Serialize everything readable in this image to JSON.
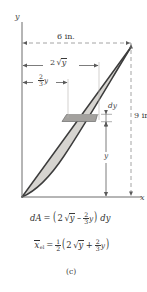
{
  "figure": {
    "caption": "(c)",
    "axes": {
      "y_label": "y",
      "x_label": "x"
    },
    "dimensions": [
      {
        "name": "top-width",
        "label": "6 in.",
        "value": 6,
        "unit": "in.",
        "orientation": "horizontal",
        "style": "dashed-extension"
      },
      {
        "name": "right-height",
        "label": "9 in.",
        "value": 9,
        "unit": "in.",
        "orientation": "vertical",
        "style": "dashed-extension"
      },
      {
        "name": "parabola-x",
        "label_parts": {
          "coef": "2",
          "radicand": "y",
          "radical": "√"
        },
        "label_plain": "2√y",
        "orientation": "horizontal"
      },
      {
        "name": "line-x",
        "label_parts": {
          "num": "2",
          "den": "3",
          "var": "y"
        },
        "label_plain": "2/3 y",
        "orientation": "horizontal"
      },
      {
        "name": "strip-thickness",
        "label": "dy",
        "orientation": "vertical"
      },
      {
        "name": "height-y",
        "label": "y",
        "orientation": "vertical"
      }
    ],
    "equations": {
      "area": {
        "lhs_d": "d",
        "lhs_A": "A",
        "eq": "=",
        "open": "(",
        "coef": "2",
        "radical": "√",
        "radicand": "y",
        "minus": "–",
        "frac_num": "2",
        "frac_den": "3",
        "frac_var": "y",
        "close": ")",
        "trail_d": "d",
        "trail_y": "y",
        "plain": "dA = (2√y – 2/3 y) dy"
      },
      "centroid": {
        "lhs_x": "x",
        "lhs_sub": "el",
        "eq": "=",
        "half_num": "1",
        "half_den": "2",
        "open": "(",
        "coef": "2",
        "radical": "√",
        "radicand": "y",
        "plus": "+",
        "frac_num": "2",
        "frac_den": "3",
        "frac_var": "y",
        "close": ")",
        "plain": "x̄_el = 1/2 (2√y + 2/3 y)"
      }
    },
    "colors": {
      "region_fill": "#d6d4d0",
      "strip_fill": "#a9a7a4",
      "curve_stroke": "#3c3c3c",
      "dash_stroke": "#8d8d8d",
      "axis_stroke": "#6d6d6d",
      "background": "#ffffff"
    },
    "geometry": {
      "origin": [
        22,
        197
      ],
      "apex": [
        131,
        47
      ],
      "x_axis_end": [
        141,
        197
      ],
      "y_axis_top": [
        22,
        22
      ],
      "strip_y": 118
    }
  }
}
